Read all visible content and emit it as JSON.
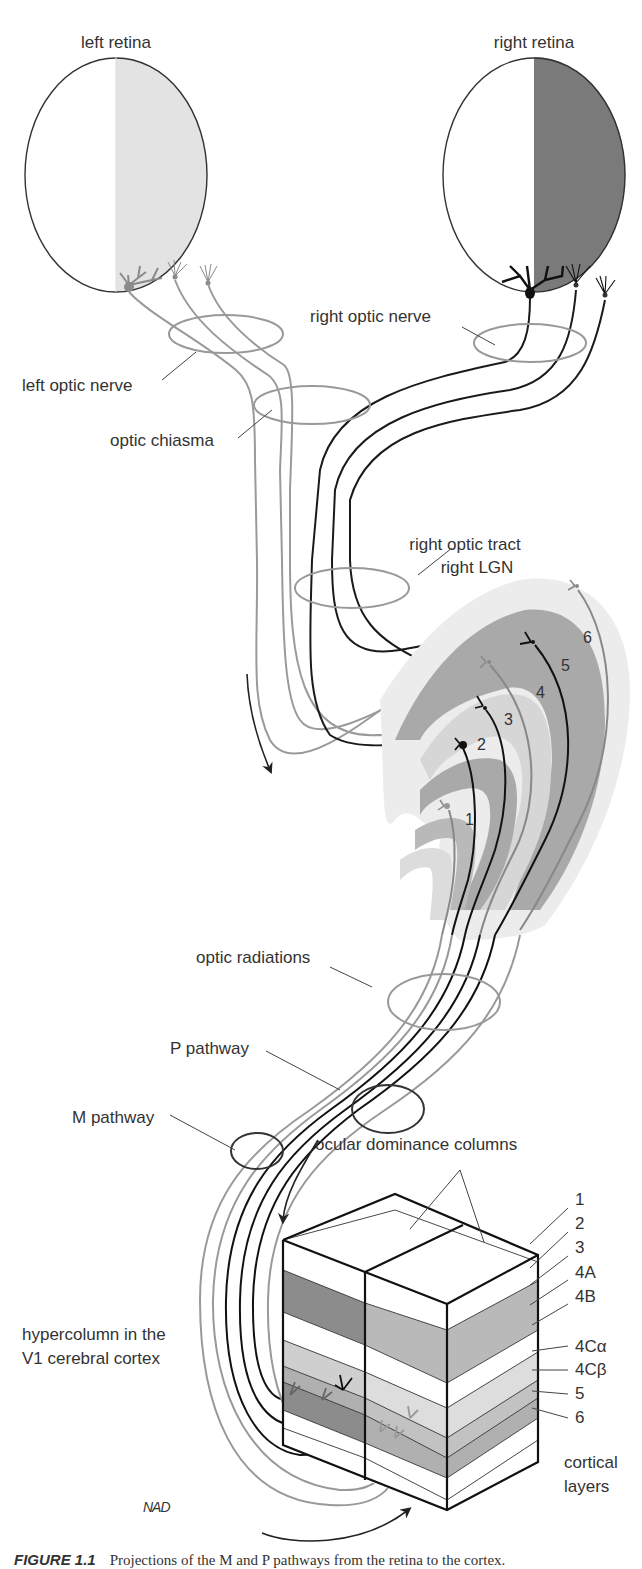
{
  "figure": {
    "colors": {
      "left_eye": "#9a9a9a",
      "right_eye": "#1a1a1a",
      "left_retina_fill": "#e3e3e3",
      "right_retina_fill": "#7a7a7a",
      "lgn_dark": "#a9a9a9",
      "lgn_light": "#d6d6d6",
      "lgn_pale": "#e9e9e9",
      "cortex_dark": "#8c8c8c",
      "cortex_mid": "#b9b9b9",
      "cortex_light": "#d8d8d8",
      "cortex_pale": "#e8e8e8"
    },
    "retinas": {
      "left": {
        "label": "left retina"
      },
      "right": {
        "label": "right retina"
      }
    },
    "labels": {
      "right_optic_nerve": "right optic nerve",
      "left_optic_nerve": "left optic nerve",
      "optic_chiasma": "optic chiasma",
      "right_optic_tract": "right optic tract",
      "right_lgn": "right  LGN",
      "optic_radiations": "optic radiations",
      "p_pathway": "P pathway",
      "m_pathway": "M pathway",
      "ocular_dominance_columns": "ocular dominance columns",
      "hypercolumn_line1": "hypercolumn in the",
      "hypercolumn_line2": "V1 cerebral cortex",
      "cortical_layers_line1": "cortical",
      "cortical_layers_line2": "layers",
      "signature": "NAD"
    },
    "lgn_layers": [
      "1",
      "2",
      "3",
      "4",
      "5",
      "6"
    ],
    "cortical_layers": [
      "1",
      "2",
      "3",
      "4A",
      "4B",
      "4Cα",
      "4Cβ",
      "5",
      "6"
    ],
    "caption": {
      "number": "FIGURE 1.1",
      "text": "Projections of the M and P pathways from the retina to the cortex."
    }
  }
}
